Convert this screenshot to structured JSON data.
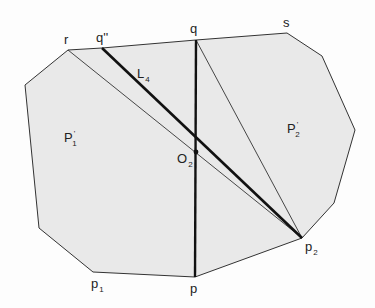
{
  "diagram": {
    "fill_color": "#e9e9e9",
    "stroke_color": "#333333",
    "polygon_vertices": [
      [
        68,
        50
      ],
      [
        102,
        48
      ],
      [
        196,
        40
      ],
      [
        287,
        33
      ],
      [
        322,
        56
      ],
      [
        355,
        130
      ],
      [
        334,
        203
      ],
      [
        302,
        238
      ],
      [
        195,
        277
      ],
      [
        93,
        272
      ],
      [
        39,
        228
      ],
      [
        25,
        85
      ]
    ],
    "labels": {
      "r": {
        "text": "r",
        "x": 64,
        "y": 33
      },
      "q2": {
        "text": "q''",
        "x": 96,
        "y": 31
      },
      "q": {
        "text": "q",
        "x": 190,
        "y": 22
      },
      "s": {
        "text": "s",
        "x": 283,
        "y": 16
      },
      "L4": {
        "text": "L",
        "sub": "4",
        "x": 137,
        "y": 67
      },
      "P1": {
        "text": "P",
        "sup": "'",
        "sub": "1",
        "x": 64,
        "y": 131
      },
      "P2": {
        "text": "P",
        "sup": "'",
        "sub": "2",
        "x": 287,
        "y": 122
      },
      "O2": {
        "text": "O",
        "sub": "2",
        "x": 177,
        "y": 152
      },
      "p": {
        "text": "p",
        "x": 190,
        "y": 282
      },
      "p1": {
        "text": "p",
        "sub": "1",
        "x": 91,
        "y": 277
      },
      "p2": {
        "text": "p",
        "sub": "2",
        "x": 305,
        "y": 240
      }
    },
    "segments": [
      {
        "name": "qp-vertical",
        "from": [
          196,
          40
        ],
        "to": [
          195,
          277
        ],
        "weight": "thick"
      },
      {
        "name": "L4",
        "from": [
          102,
          48
        ],
        "to": [
          302,
          238
        ],
        "weight": "thick"
      },
      {
        "name": "r-p2",
        "from": [
          68,
          50
        ],
        "to": [
          302,
          238
        ],
        "weight": "thin"
      },
      {
        "name": "q-p2",
        "from": [
          196,
          40
        ],
        "to": [
          302,
          238
        ],
        "weight": "thin"
      }
    ],
    "points": [
      {
        "name": "O2",
        "at": [
          196,
          152
        ]
      }
    ]
  }
}
